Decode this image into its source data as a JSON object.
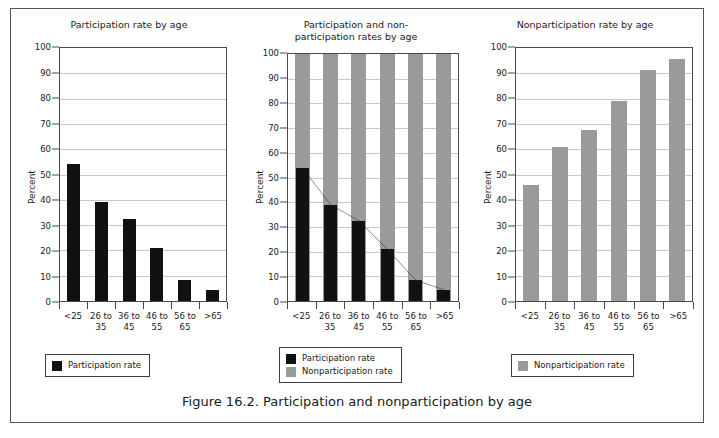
{
  "figure": {
    "caption": "Figure 16.2. Participation and nonparticipation by age"
  },
  "axis": {
    "y_title": "Percent",
    "y_ticks": [
      "0",
      "10",
      "20",
      "30",
      "40",
      "50",
      "60",
      "70",
      "80",
      "90",
      "100"
    ],
    "categories": [
      "<25",
      "26 to 35",
      "36 to 45",
      "46 to 55",
      "56 to 65",
      ">65"
    ]
  },
  "legend": {
    "participation_label": "Participation rate",
    "nonparticipation_label": "Nonparticipation rate"
  },
  "colors": {
    "participation": "#111111",
    "nonparticipation": "#9a9a9a",
    "gridline": "#c9c9c9",
    "axis": "#4a4a4a",
    "frame": "#555555"
  },
  "panels": [
    {
      "title": "Participation rate by age"
    },
    {
      "title": "Participation and non-\nparticipation rates by age",
      "title_line1": "Participation and non-",
      "title_line2": "participation rates by age"
    },
    {
      "title": "Nonparticipation rate by age"
    }
  ],
  "chart_data": [
    {
      "type": "bar",
      "title": "Participation rate by age",
      "xlabel": "",
      "ylabel": "Percent",
      "ylim": [
        0,
        100
      ],
      "ytick_step": 10,
      "grid": true,
      "legend_position": "below",
      "categories": [
        "<25",
        "26 to 35",
        "36 to 45",
        "46 to 55",
        "56 to 65",
        ">65"
      ],
      "series": [
        {
          "name": "Participation rate",
          "color": "#111111",
          "values": [
            54,
            39,
            32.5,
            21,
            8.5,
            4.5
          ]
        }
      ]
    },
    {
      "type": "bar",
      "title": "Participation and non-participation rates by age",
      "xlabel": "",
      "ylabel": "Percent",
      "ylim": [
        0,
        100
      ],
      "ytick_step": 10,
      "grid": true,
      "legend_position": "below",
      "note": "Gray nonparticipation bars drawn full height to 100; black participation bars overlaid in front; a line connects the tops of the participation bars.",
      "categories": [
        "<25",
        "26 to 35",
        "36 to 45",
        "46 to 55",
        "56 to 65",
        ">65"
      ],
      "series": [
        {
          "name": "Nonparticipation rate",
          "color": "#9a9a9a",
          "values": [
            100,
            100,
            100,
            100,
            100,
            100
          ]
        },
        {
          "name": "Participation rate",
          "color": "#111111",
          "values": [
            54,
            39,
            32.5,
            21,
            8.5,
            4.5
          ]
        }
      ],
      "overlay_line": {
        "name": "Participation rate trend",
        "values": [
          54,
          39,
          32.5,
          21,
          8.5,
          4.5
        ]
      }
    },
    {
      "type": "bar",
      "title": "Nonparticipation rate by age",
      "xlabel": "",
      "ylabel": "Percent",
      "ylim": [
        0,
        100
      ],
      "ytick_step": 10,
      "grid": true,
      "legend_position": "below",
      "categories": [
        "<25",
        "26 to 35",
        "36 to 45",
        "46 to 55",
        "56 to 65",
        ">65"
      ],
      "series": [
        {
          "name": "Nonparticipation rate",
          "color": "#9a9a9a",
          "values": [
            46,
            61,
            67.5,
            79,
            91.5,
            95.5
          ]
        }
      ]
    }
  ]
}
